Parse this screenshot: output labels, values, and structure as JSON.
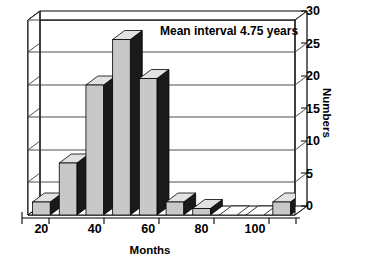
{
  "chart_data": {
    "type": "bar",
    "title": "",
    "subtitle": "",
    "xlabel": "Months",
    "ylabel": "Numbers",
    "categories": [
      20,
      30,
      40,
      50,
      60,
      70,
      80,
      90,
      100,
      110
    ],
    "values": [
      2,
      8,
      20,
      27,
      21,
      2,
      1,
      0,
      0,
      2
    ],
    "series": [
      {
        "name": "Numbers",
        "values": [
          2,
          8,
          20,
          27,
          21,
          2,
          1,
          0,
          0,
          2
        ]
      }
    ],
    "xtick_labels": [
      "20",
      "40",
      "60",
      "80",
      "100"
    ],
    "xtick_values": [
      20,
      40,
      60,
      80,
      100
    ],
    "ytick_labels": [
      "0",
      "5",
      "10",
      "15",
      "20",
      "25",
      "30"
    ],
    "ytick_values": [
      0,
      5,
      10,
      15,
      20,
      25,
      30
    ],
    "ylim": [
      0,
      30
    ],
    "xlim": [
      15,
      115
    ],
    "grid": true,
    "grid_axis": "y",
    "legend": false,
    "legend_position": "none",
    "style": "3d-column",
    "annotations": [
      {
        "text": "Mean interval 4.75 years",
        "x": 70,
        "y": 28
      }
    ],
    "colors": {
      "bar_front": "#c8c8c8",
      "bar_top": "#e2e2e2",
      "bar_side": "#1a1a1a",
      "wall": "#ffffff",
      "floor": "#f2f2f2",
      "grid": "#555555",
      "axis": "#000000",
      "text": "#000000"
    }
  },
  "axes": {
    "y_title": "Numbers",
    "x_title": "Months"
  },
  "annotation": {
    "mean_interval": "Mean interval 4.75 years"
  }
}
